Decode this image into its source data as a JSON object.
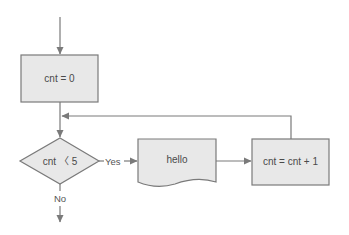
{
  "diagram": {
    "type": "flowchart",
    "nodes": {
      "init": {
        "label": "cnt = 0",
        "shape": "process"
      },
      "cond": {
        "label": "cnt 〈 5",
        "shape": "decision"
      },
      "print": {
        "label": "hello",
        "shape": "document"
      },
      "incr": {
        "label": "cnt = cnt + 1",
        "shape": "process"
      }
    },
    "edges": {
      "yes_label": "Yes",
      "no_label": "No"
    },
    "colors": {
      "fill": "#e8e8e8",
      "stroke": "#7a7a7a",
      "text": "#4a4a4a"
    }
  }
}
